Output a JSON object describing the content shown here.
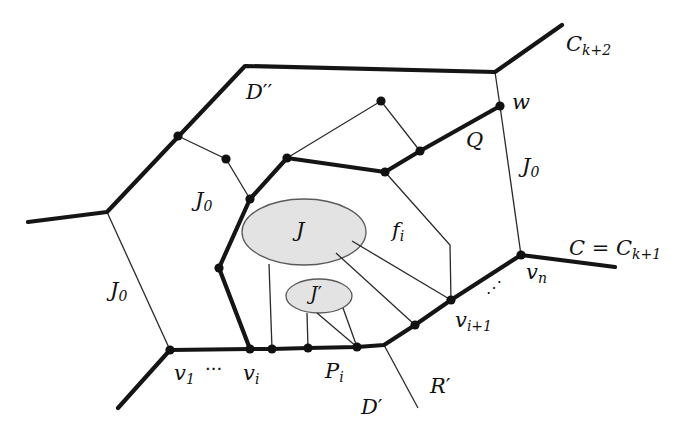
{
  "figure": {
    "labels": {
      "c_k2": {
        "base": "C",
        "sub": "k+2"
      },
      "d_double_prime": {
        "base": "D",
        "prime": "′′"
      },
      "w": {
        "base": "w"
      },
      "q": {
        "base": "Q"
      },
      "j0_right": {
        "base": "J",
        "sub": "0"
      },
      "j0_middle": {
        "base": "J",
        "sub": "0"
      },
      "j0_left": {
        "base": "J",
        "sub": "0"
      },
      "j": {
        "base": "J"
      },
      "f_i": {
        "base": "f",
        "sub": "i"
      },
      "c_eq": {
        "base": "C",
        "eq": " = ",
        "base2": "C",
        "sub": "k+1"
      },
      "v_n": {
        "base": "v",
        "sub": "n"
      },
      "dots_right": {
        "text": "⋰"
      },
      "j_prime": {
        "base": "J",
        "prime": "′"
      },
      "v_i1": {
        "base": "v",
        "sub": "i+1"
      },
      "v_1": {
        "base": "v",
        "sub": "1"
      },
      "dots_left": {
        "text": "···"
      },
      "v_i": {
        "base": "v",
        "sub": "i"
      },
      "p_i": {
        "base": "P",
        "sub": "i"
      },
      "r_prime": {
        "base": "R",
        "prime": "′"
      },
      "d_prime": {
        "base": "D",
        "prime": "′"
      }
    },
    "colors": {
      "edge": "#151515",
      "component_fill": "#e3e3e3",
      "component_stroke": "#5a5a5a",
      "background": "#ffffff"
    }
  }
}
